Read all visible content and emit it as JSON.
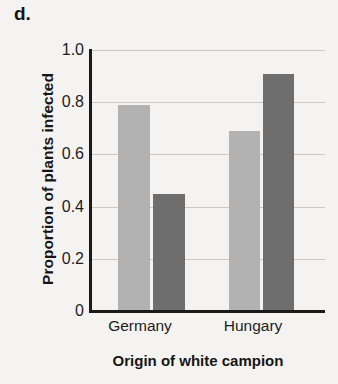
{
  "figure": {
    "panel_label": "d."
  },
  "chart_data": {
    "type": "bar",
    "title": "",
    "subtitle": "",
    "xlabel": "Origin of white campion",
    "ylabel": "Proportion of plants infected",
    "categories": [
      "Germany",
      "Hungary"
    ],
    "series": [
      {
        "name": "light-series",
        "color": "#b2b2b2",
        "values": [
          0.79,
          0.69
        ]
      },
      {
        "name": "dark-series",
        "color": "#6e6e6e",
        "values": [
          0.45,
          0.91
        ]
      }
    ],
    "ylim": [
      0,
      1.0
    ],
    "yticks": [
      "1.0",
      "0.8",
      "0.6",
      "0.4",
      "0.2",
      "0"
    ],
    "ytick_values": [
      1.0,
      0.8,
      0.6,
      0.4,
      0.2,
      0
    ],
    "grid": "horizontal",
    "legend": "none",
    "annotations": []
  },
  "colors": {
    "background": "#f4f3f1",
    "axis": "#1a1a1a",
    "gridline": "#c9c9c9",
    "text": "#1a1a1a",
    "bar_light": "#b2b2b2",
    "bar_dark": "#6e6e6e"
  }
}
